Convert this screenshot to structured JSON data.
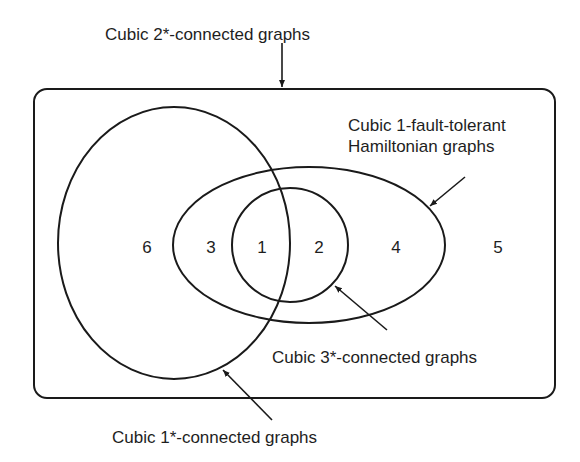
{
  "diagram": {
    "type": "venn",
    "sets": {
      "outer": {
        "label": "Cubic 2*-connected graphs"
      },
      "one_star": {
        "label": "Cubic 1*-connected graphs"
      },
      "hamiltonian": {
        "label_line1": "Cubic 1-fault-tolerant",
        "label_line2": "Hamiltonian graphs"
      },
      "three_star": {
        "label": "Cubic 3*-connected graphs"
      }
    },
    "regions": [
      {
        "id": "r6",
        "label": "6"
      },
      {
        "id": "r3",
        "label": "3"
      },
      {
        "id": "r1",
        "label": "1"
      },
      {
        "id": "r2",
        "label": "2"
      },
      {
        "id": "r4",
        "label": "4"
      },
      {
        "id": "r5",
        "label": "5"
      }
    ],
    "colors": {
      "stroke": "#1a1a1a",
      "text": "#1e1e1e",
      "background": "#ffffff"
    }
  }
}
